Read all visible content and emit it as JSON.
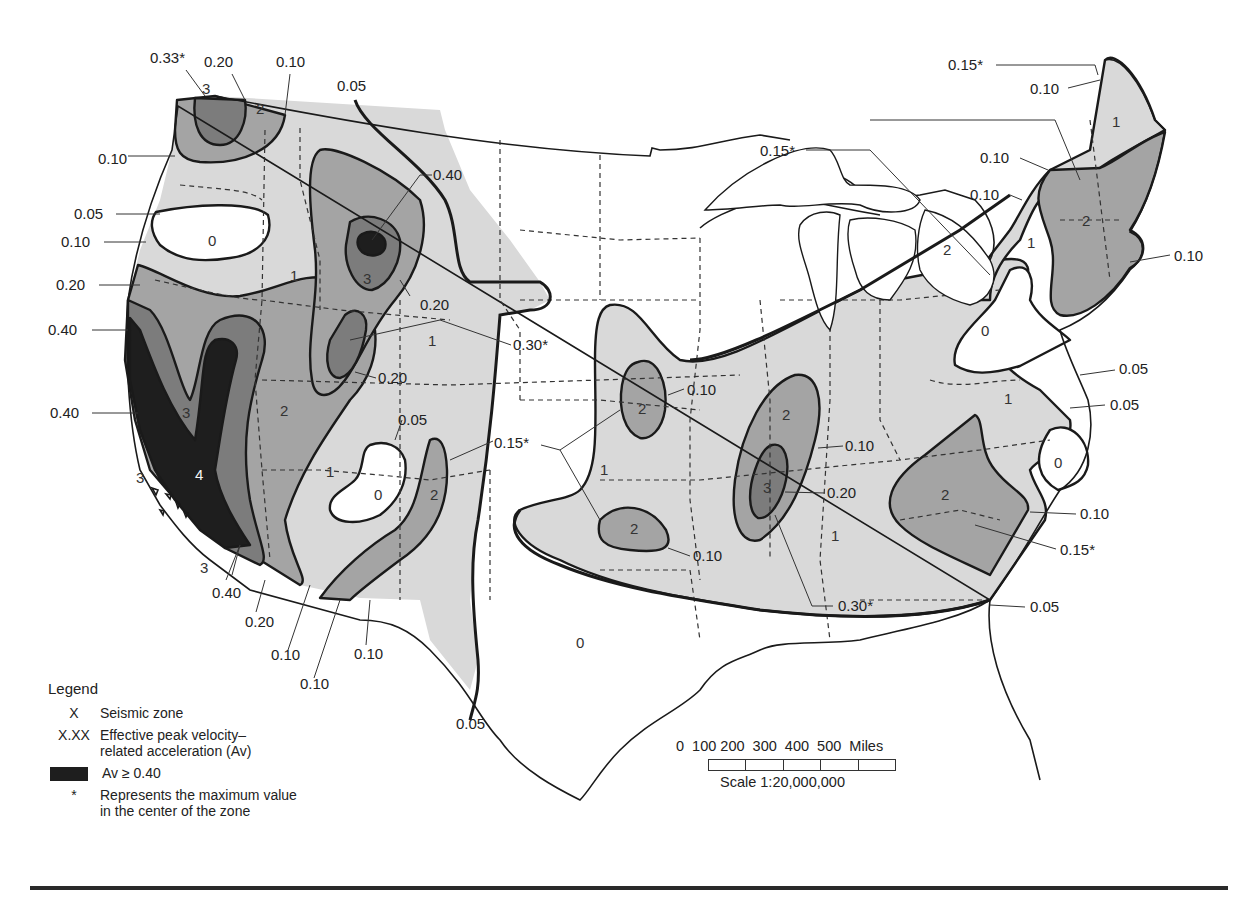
{
  "map": {
    "title": "Seismic zones and effective peak velocity-related acceleration (Av) — contiguous United States",
    "colors": {
      "zone0": "#ffffff",
      "zone1": "#d9d9d9",
      "zone2": "#a4a4a4",
      "zone3": "#7c7c7c",
      "zone4": "#1e1e1e",
      "contour": "#1a1a1a",
      "state_boundary": "#333333"
    },
    "zone_labels": [
      {
        "text": "3",
        "x": 202,
        "y": 94
      },
      {
        "text": "2",
        "x": 256,
        "y": 114
      },
      {
        "text": "0",
        "x": 212,
        "y": 246
      },
      {
        "text": "1",
        "x": 292,
        "y": 281
      },
      {
        "text": "3",
        "x": 367,
        "y": 282
      },
      {
        "text": "1",
        "x": 430,
        "y": 346
      },
      {
        "text": "3",
        "x": 186,
        "y": 416
      },
      {
        "text": "2",
        "x": 284,
        "y": 414
      },
      {
        "text": "4",
        "x": 199,
        "y": 478
      },
      {
        "text": "3",
        "x": 141,
        "y": 483
      },
      {
        "text": "3",
        "x": 205,
        "y": 573
      },
      {
        "text": "1",
        "x": 330,
        "y": 475
      },
      {
        "text": "0",
        "x": 378,
        "y": 499
      },
      {
        "text": "2",
        "x": 434,
        "y": 499
      },
      {
        "text": "2",
        "x": 642,
        "y": 413
      },
      {
        "text": "1",
        "x": 604,
        "y": 474
      },
      {
        "text": "2",
        "x": 634,
        "y": 533
      },
      {
        "text": "2",
        "x": 786,
        "y": 419
      },
      {
        "text": "3",
        "x": 767,
        "y": 492
      },
      {
        "text": "1",
        "x": 835,
        "y": 540
      },
      {
        "text": "0",
        "x": 580,
        "y": 648
      },
      {
        "text": "2",
        "x": 945,
        "y": 499
      },
      {
        "text": "1",
        "x": 1008,
        "y": 404
      },
      {
        "text": "0",
        "x": 1058,
        "y": 468
      },
      {
        "text": "0",
        "x": 985,
        "y": 336
      },
      {
        "text": "1",
        "x": 1031,
        "y": 248
      },
      {
        "text": "2",
        "x": 947,
        "y": 254
      },
      {
        "text": "2",
        "x": 1086,
        "y": 225
      },
      {
        "text": "1",
        "x": 1116,
        "y": 127
      }
    ],
    "contour_labels": [
      {
        "text": "0.33*",
        "x": 153,
        "y": 63
      },
      {
        "text": "0.20",
        "x": 207,
        "y": 67
      },
      {
        "text": "0.10",
        "x": 277,
        "y": 67
      },
      {
        "text": "0.05",
        "x": 338,
        "y": 91
      },
      {
        "text": "0.10",
        "x": 100,
        "y": 160
      },
      {
        "text": "0.05",
        "x": 74,
        "y": 218
      },
      {
        "text": "0.10",
        "x": 62,
        "y": 246
      },
      {
        "text": "0.20",
        "x": 57,
        "y": 289
      },
      {
        "text": "0.40",
        "x": 48,
        "y": 334
      },
      {
        "text": "0.40",
        "x": 50,
        "y": 417
      },
      {
        "text": "0.40",
        "x": 433,
        "y": 178
      },
      {
        "text": "0.20",
        "x": 420,
        "y": 308
      },
      {
        "text": "0.30*",
        "x": 513,
        "y": 350
      },
      {
        "text": "0.20",
        "x": 378,
        "y": 381
      },
      {
        "text": "0.05",
        "x": 399,
        "y": 424
      },
      {
        "text": "0.15*",
        "x": 494,
        "y": 446
      },
      {
        "text": "0.40",
        "x": 212,
        "y": 598
      },
      {
        "text": "0.20",
        "x": 245,
        "y": 627
      },
      {
        "text": "0.10",
        "x": 271,
        "y": 660
      },
      {
        "text": "0.10",
        "x": 300,
        "y": 688
      },
      {
        "text": "0.10",
        "x": 354,
        "y": 659
      },
      {
        "text": "0.05",
        "x": 456,
        "y": 728
      },
      {
        "text": "0.10",
        "x": 687,
        "y": 394
      },
      {
        "text": "0.10",
        "x": 693,
        "y": 560
      },
      {
        "text": "0.10",
        "x": 845,
        "y": 450
      },
      {
        "text": "0.20",
        "x": 827,
        "y": 497
      },
      {
        "text": "0.30*",
        "x": 838,
        "y": 610
      },
      {
        "text": "0.15*",
        "x": 762,
        "y": 154
      },
      {
        "text": "0.15*",
        "x": 949,
        "y": 68
      },
      {
        "text": "0.10",
        "x": 1030,
        "y": 92
      },
      {
        "text": "0.10",
        "x": 980,
        "y": 162
      },
      {
        "text": "0.10",
        "x": 970,
        "y": 199
      },
      {
        "text": "0.10",
        "x": 1174,
        "y": 260
      },
      {
        "text": "0.05",
        "x": 1119,
        "y": 373
      },
      {
        "text": "0.05",
        "x": 1110,
        "y": 409
      },
      {
        "text": "0.10",
        "x": 1080,
        "y": 518
      },
      {
        "text": "0.15*",
        "x": 1060,
        "y": 553
      },
      {
        "text": "0.05",
        "x": 1030,
        "y": 611
      }
    ]
  },
  "legend": {
    "title": "Legend",
    "items": [
      {
        "key": "X",
        "label_line1": "Seismic zone",
        "label_line2": ""
      },
      {
        "key": "X.XX",
        "label_line1": "Effective peak velocity–",
        "label_line2": "related acceleration (Av)"
      },
      {
        "key": "swatch",
        "label_line1": "Av ≥ 0.40",
        "label_line2": ""
      },
      {
        "key": "*",
        "label_line1": "Represents the maximum value",
        "label_line2": "in the center of the zone"
      }
    ]
  },
  "scale_bar": {
    "ticks": "0  100 200  300  400  500  Miles",
    "ratio": "Scale 1:20,000,000"
  }
}
